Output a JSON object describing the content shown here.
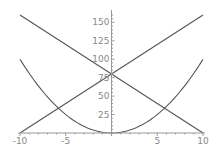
{
  "chart_data": {
    "type": "line",
    "title": "",
    "xlabel": "",
    "ylabel": "",
    "xlim": [
      -10,
      10
    ],
    "ylim": [
      0,
      160
    ],
    "grid": false,
    "legend": null,
    "x_ticks": [
      -10,
      -5,
      5,
      10
    ],
    "x_tick_labels": [
      "-10",
      "-5",
      "5",
      "10"
    ],
    "y_ticks": [
      25,
      50,
      75,
      100,
      125,
      150
    ],
    "y_tick_labels": [
      "25",
      "50",
      "75",
      "100",
      "125",
      "150"
    ],
    "series": [
      {
        "name": "parabola",
        "formula": "y = x^2",
        "x": [
          -10,
          -8,
          -6,
          -4,
          -2,
          0,
          2,
          4,
          6,
          8,
          10
        ],
        "values": [
          100,
          64,
          36,
          16,
          4,
          0,
          4,
          16,
          36,
          64,
          100
        ]
      },
      {
        "name": "rising-line",
        "formula": "y = 80 + 8x",
        "x": [
          -10,
          0,
          10
        ],
        "values": [
          0,
          80,
          160
        ]
      },
      {
        "name": "falling-line",
        "formula": "y = 80 - 8x",
        "x": [
          -10,
          0,
          10
        ],
        "values": [
          160,
          80,
          0
        ]
      }
    ]
  },
  "colors": {
    "curve": "#555555",
    "axis": "#999999",
    "tick_label": "#888888",
    "background": "#ffffff"
  }
}
